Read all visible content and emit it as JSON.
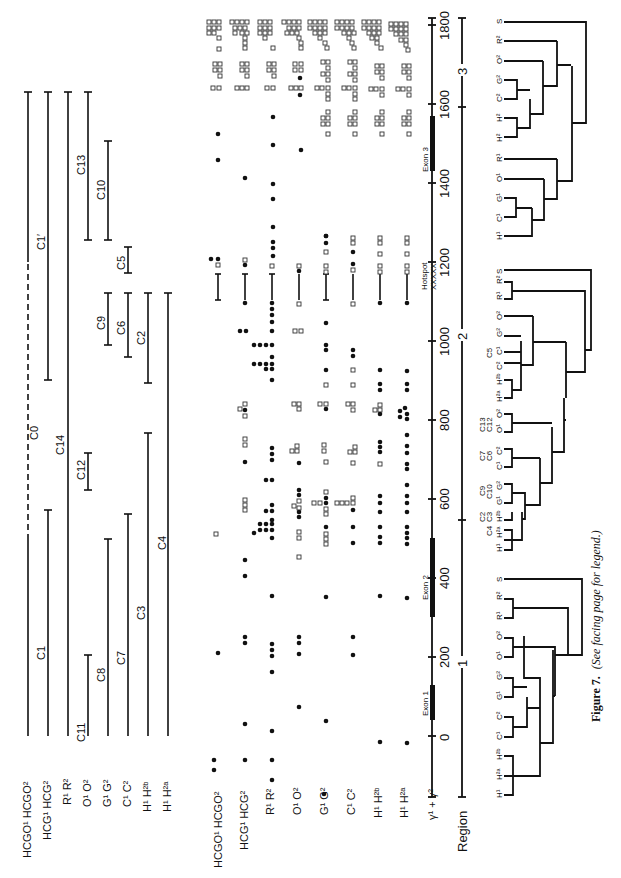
{
  "figure": {
    "caption_bold": "Figure 7.",
    "caption_italic": "(See facing page for legend.)",
    "orientation": "rotated 90 degrees counter-clockwise"
  },
  "axis": {
    "label": "γ¹ + γ²",
    "region_label": "Region",
    "ticks": [
      "0",
      "200",
      "400",
      "600",
      "800",
      "1000",
      "1200",
      "1400",
      "1600",
      "1800"
    ],
    "regions": [
      "1",
      "2",
      "3"
    ],
    "exons": [
      "Exon 1",
      "Exon 2",
      "Exon 3"
    ],
    "hotspot_label": "Hotspot",
    "hotspot_marks": "XXXXX"
  },
  "segments_panel": {
    "row_labels": [
      "HCGO¹ HCGO²",
      "HCG¹ HCG²",
      "R¹ R²",
      "O¹ O²",
      "G¹ G²",
      "C¹ C²",
      "H¹ H²ᵇ",
      "H¹ H²ᵃ"
    ],
    "segments": [
      {
        "name": "C0",
        "row": 0,
        "from": 0,
        "to": 1680,
        "dashed_from": 560,
        "dashed_to": 1340
      },
      {
        "name": "C1'",
        "row": 1,
        "from": 900,
        "to": 1680
      },
      {
        "name": "C1",
        "row": 1,
        "from": 0,
        "to": 580
      },
      {
        "name": "C14",
        "row": 2,
        "from": 0,
        "to": 1680
      },
      {
        "name": "C11",
        "row": 3,
        "from": 0,
        "to": 200
      },
      {
        "name": "C12",
        "row": 3,
        "from": 640,
        "to": 720
      },
      {
        "name": "C13",
        "row": 3,
        "from": 1290,
        "to": 1680
      },
      {
        "name": "C8",
        "row": 4,
        "from": 0,
        "to": 520
      },
      {
        "name": "C9",
        "row": 4,
        "from": 1020,
        "to": 1160
      },
      {
        "name": "C10",
        "row": 4,
        "from": 1290,
        "to": 1560
      },
      {
        "name": "C7",
        "row": 5,
        "from": 0,
        "to": 580
      },
      {
        "name": "C6",
        "row": 5,
        "from": 980,
        "to": 1160
      },
      {
        "name": "C5",
        "row": 5,
        "from": 1190,
        "to": 1260
      },
      {
        "name": "C3",
        "row": 6,
        "from": 0,
        "to": 780
      },
      {
        "name": "C2",
        "row": 6,
        "from": 940,
        "to": 1160
      },
      {
        "name": "C4",
        "row": 7,
        "from": 0,
        "to": 1160
      }
    ]
  },
  "dots_panel": {
    "row_labels": [
      "HCGO¹ HCGO²",
      "HCG¹ HCG²",
      "R¹ R²",
      "O¹ O²",
      "G¹ G²",
      "C¹ C²",
      "H¹ H²ᵇ",
      "H¹ H²ᵃ",
      "γ¹ + γ²"
    ],
    "legend": {
      "filled": "filled circle",
      "open": "open square"
    }
  },
  "dendrograms": [
    {
      "id": "region-1",
      "leaves": [
        "H¹",
        "H²ᵃ",
        "H²ᵇ",
        "C¹",
        "C²",
        "G¹",
        "G²",
        "O¹",
        "O²",
        "R¹",
        "R²",
        "S"
      ]
    },
    {
      "id": "region-2",
      "leaves": [
        "H¹",
        "H²ᵃ",
        "H²ᵇ",
        "G¹",
        "G²",
        "C¹",
        "C²",
        "O¹",
        "O²",
        "H²ᵃ",
        "H²ᵇ",
        "C²",
        "C¹",
        "G²",
        "O²",
        "R¹",
        "R²",
        "S"
      ],
      "group_labels": [
        "C4",
        "C2",
        "C3",
        "C9",
        "C10",
        "C7",
        "C6",
        "C13",
        "C12",
        "C5"
      ]
    },
    {
      "id": "region-3",
      "leaves": [
        "H¹",
        "C¹",
        "G¹",
        "O¹",
        "R¹",
        "H²",
        "H²",
        "C²",
        "G²",
        "O²",
        "R²",
        "S"
      ]
    }
  ]
}
